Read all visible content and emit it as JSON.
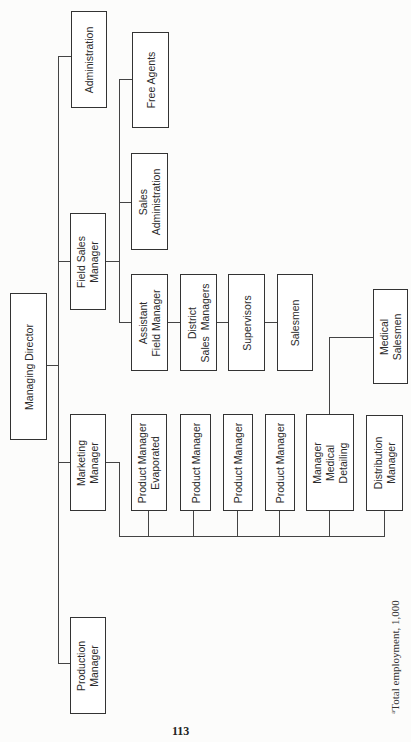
{
  "chart_title": "",
  "orientation": "rotated -90deg (landscape org chart printed on portrait page)",
  "nodes": {
    "managing_director": "Managing Director",
    "administration": "Administration",
    "field_sales_manager": "Field Sales\nManager",
    "free_agents": "Free Agents",
    "sales_administration": "Sales\nAdministration",
    "assistant_field_manager": "Assistant\nField Manager",
    "district_sales_managers": "District\nSales  Managers",
    "supervisors": "Supervisors",
    "salesmen": "Salesmen",
    "marketing_manager": "Marketing\nManager",
    "product_manager_evaporated": "Product Manager\nEvaporated",
    "product_manager_1": "Product Manager",
    "product_manager_2": "Product Manager",
    "product_manager_3": "Product Manager",
    "manager_medical_detailing": "Manager\nMedical\nDetailing",
    "distribution_manager": "Distribution\nManager",
    "medical_salesmen": "Medical\nSalesmen",
    "production_manager": "Production\nManager"
  },
  "hierarchy": {
    "Managing Director": [
      "Administration",
      "Field Sales Manager",
      "Marketing Manager",
      "Production Manager"
    ],
    "Field Sales Manager": [
      "Free Agents",
      "Sales Administration",
      "Assistant Field Manager"
    ],
    "Assistant Field Manager": [
      "District Sales Managers"
    ],
    "District Sales Managers": [
      "Supervisors"
    ],
    "Supervisors": [
      "Salesmen"
    ],
    "Marketing Manager": [
      "Product Manager Evaporated",
      "Product Manager",
      "Product Manager",
      "Product Manager",
      "Manager Medical Detailing",
      "Distribution Manager"
    ],
    "Manager Medical Detailing": [
      "Medical Salesmen"
    ]
  },
  "footnote": {
    "marker": "a",
    "text": "Total employment, 1,000"
  },
  "page_number": "113",
  "colors": {
    "line": "#444444",
    "box_border": "#333333",
    "text": "#2b2b2b",
    "background": "#fcfcfb"
  }
}
